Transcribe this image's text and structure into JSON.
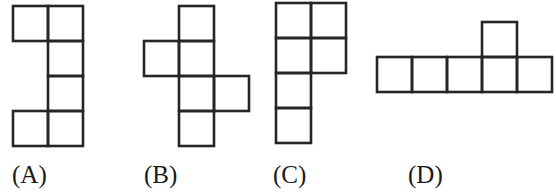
{
  "figure": {
    "cell_size_px": 35,
    "options": [
      {
        "label": "(A)",
        "origin": [
          13,
          6
        ],
        "cells": [
          [
            0,
            0
          ],
          [
            1,
            0
          ],
          [
            1,
            1
          ],
          [
            1,
            2
          ],
          [
            0,
            3
          ],
          [
            1,
            3
          ]
        ]
      },
      {
        "label": "(B)",
        "origin": [
          144,
          6
        ],
        "cells": [
          [
            1,
            0
          ],
          [
            0,
            1
          ],
          [
            1,
            1
          ],
          [
            1,
            2
          ],
          [
            2,
            2
          ],
          [
            1,
            3
          ]
        ]
      },
      {
        "label": "(C)",
        "origin": [
          276,
          3
        ],
        "cells": [
          [
            0,
            0
          ],
          [
            1,
            0
          ],
          [
            0,
            1
          ],
          [
            1,
            1
          ],
          [
            0,
            2
          ],
          [
            0,
            3
          ]
        ]
      },
      {
        "label": "(D)",
        "origin": [
          377,
          22
        ],
        "cells": [
          [
            3,
            0
          ],
          [
            0,
            1
          ],
          [
            1,
            1
          ],
          [
            2,
            1
          ],
          [
            3,
            1
          ],
          [
            4,
            1
          ]
        ]
      }
    ]
  },
  "labels": {
    "a": "(A)",
    "b": "(B)",
    "c": "(C)",
    "d": "(D)"
  },
  "colors": {
    "stroke": "#262626",
    "background": "#ffffff"
  }
}
